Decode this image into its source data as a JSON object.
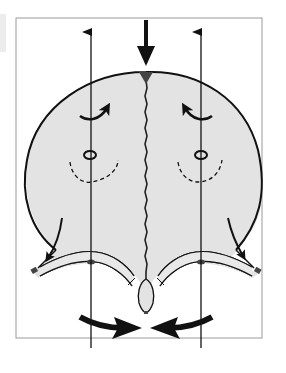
{
  "figure": {
    "colors": {
      "background": "#ffffff",
      "frame": "#9a9a9a",
      "skull_fill": "#e3e3e3",
      "outline": "#111111",
      "dark_marker": "#444444",
      "margin_strip": "#ececec"
    },
    "frame": {
      "x": 16,
      "y": 18,
      "width": 246,
      "height": 320
    },
    "elements": {
      "vertical_arrows": [
        {
          "name": "left-vertical-arrow",
          "x": 91,
          "y_top": 28,
          "y_bottom": 348,
          "direction": "up"
        },
        {
          "name": "right-vertical-arrow",
          "x": 201,
          "y_top": 28,
          "y_bottom": 348,
          "direction": "up"
        }
      ],
      "top_arrow": {
        "x": 146,
        "y_top": 20,
        "y_tip": 70,
        "direction": "down"
      },
      "rotation_arrows": [
        {
          "name": "left-rotation-arrow",
          "side": "left",
          "direction": "clockwise-up"
        },
        {
          "name": "right-rotation-arrow",
          "side": "right",
          "direction": "counterclockwise-up"
        }
      ],
      "oval_markers": [
        {
          "name": "left-oval",
          "cx": 90,
          "cy": 155
        },
        {
          "name": "right-oval",
          "cx": 201,
          "cy": 155
        }
      ],
      "bottom_arrows": [
        {
          "name": "left-bottom-arrow",
          "direction": "right"
        },
        {
          "name": "right-bottom-arrow",
          "direction": "left"
        }
      ],
      "midline_suture": {
        "x": 146,
        "y_top": 80,
        "y_bottom": 283
      }
    }
  }
}
